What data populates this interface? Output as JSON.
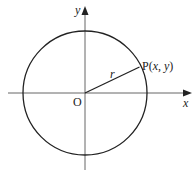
{
  "diagram": {
    "type": "unit-circle-coordinate",
    "colors": {
      "stroke": "#222222",
      "axis": "#555555",
      "background": "#ffffff"
    },
    "axes": {
      "x_label": "x",
      "y_label": "y"
    },
    "origin_label": "O",
    "radius_label": "r",
    "point_label": "P(x, y)",
    "point": {
      "name": "P",
      "coords": "(x, y)"
    }
  }
}
